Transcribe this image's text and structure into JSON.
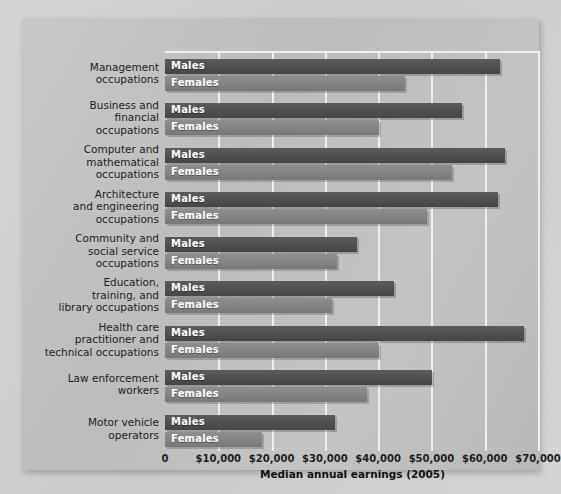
{
  "chart_data": {
    "type": "bar",
    "orientation": "horizontal",
    "title": "",
    "xlabel": "Median annual earnings (2005)",
    "ylabel": "",
    "xlim": [
      0,
      70000
    ],
    "xticks": [
      0,
      10000,
      20000,
      30000,
      40000,
      50000,
      60000,
      70000
    ],
    "xticklabels": [
      "0",
      "$10,000",
      "$20,000",
      "$30,000",
      "$40,000",
      "$50,000",
      "$60,000",
      "$70,000"
    ],
    "grid": true,
    "legend": "in-bar",
    "categories": [
      "Management occupations",
      "Business and financial occupations",
      "Computer and mathematical occupations",
      "Architecture and engineering occupations",
      "Community and social service occupations",
      "Education, training, and library occupations",
      "Health care practitioner and technical occupations",
      "Law enforcement workers",
      "Motor vehicle operators"
    ],
    "series": [
      {
        "name": "Males",
        "color": "#4f4f4f",
        "values": [
          62800,
          55700,
          63800,
          62500,
          36000,
          43000,
          67300,
          50100,
          31900
        ]
      },
      {
        "name": "Females",
        "color": "#848484",
        "values": [
          45000,
          40100,
          53800,
          49200,
          32300,
          31300,
          40200,
          37900,
          18200
        ]
      }
    ]
  },
  "axis": {
    "x_title": "Median annual earnings (2005)",
    "tick_labels": [
      "0",
      "$10,000",
      "$20,000",
      "$30,000",
      "$40,000",
      "$50,000",
      "$60,000",
      "$70,000"
    ]
  },
  "category_lines": [
    [
      "Management",
      "occupations"
    ],
    [
      "Business and",
      "financial",
      "occupations"
    ],
    [
      "Computer and",
      "mathematical",
      "occupations"
    ],
    [
      "Architecture",
      "and engineering",
      "occupations"
    ],
    [
      "Community and",
      "social service",
      "occupations"
    ],
    [
      "Education,",
      "training, and",
      "library occupations"
    ],
    [
      "Health care",
      "practitioner and",
      "technical occupations"
    ],
    [
      "Law enforcement",
      "workers"
    ],
    [
      "Motor vehicle",
      "operators"
    ]
  ],
  "series_labels": {
    "male": "Males",
    "female": "Females"
  },
  "colors": {
    "male_bar": "#4f4f4f",
    "female_bar": "#848484",
    "background": "#c4c4c4",
    "gridline": "#efefef",
    "text": "#1d1d1d"
  }
}
